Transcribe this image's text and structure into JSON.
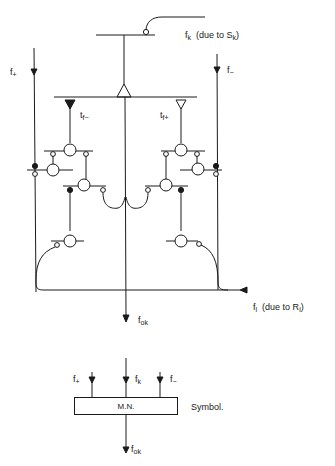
{
  "diagram": {
    "labels": {
      "fk_main": "f",
      "fk_main_sub": "k",
      "fk_note": "(due to S",
      "fk_note_sub": "k",
      "fk_note_end": ")",
      "fplus": "f",
      "fplus_sub": "+",
      "fminus": "f",
      "fminus_sub": "−",
      "tfminus": "t",
      "tfminus_sub": "f−",
      "tfplus": "t",
      "tfplus_sub": "f+",
      "fl": "f",
      "fl_sub": "l",
      "fl_note": "(due to R",
      "fl_note_sub": "l",
      "fl_note_end": ")",
      "fok": "f",
      "fok_sub": "ok"
    },
    "symbol": {
      "box_label": "M.N.",
      "caption": "Symbol.",
      "inputs": [
        {
          "label": "f",
          "sub": "+"
        },
        {
          "label": "f",
          "sub": "k"
        },
        {
          "label": "f",
          "sub": "−"
        }
      ],
      "output": {
        "label": "f",
        "sub": "ok"
      }
    }
  }
}
